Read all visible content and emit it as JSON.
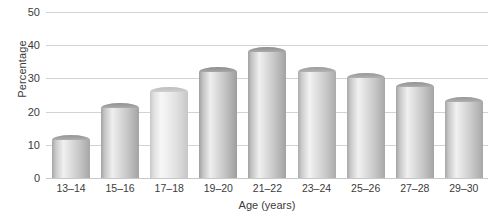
{
  "chart_data": {
    "type": "bar",
    "title": "",
    "xlabel": "Age (years)",
    "ylabel": "Percentage",
    "categories": [
      "13–14",
      "15–16",
      "17–18",
      "19–20",
      "21–22",
      "23–24",
      "25–26",
      "27–28",
      "29–30"
    ],
    "values": [
      11.5,
      21,
      26,
      32,
      38,
      32,
      30,
      27.5,
      23
    ],
    "ylim": [
      0,
      50
    ],
    "yticks": [
      0,
      10,
      20,
      30,
      40,
      50
    ],
    "ytick_labels": [
      "0",
      "10",
      "20",
      "30",
      "40",
      "50"
    ],
    "grid": true,
    "legend": "none",
    "series": [
      {
        "name": "Percentage",
        "values": [
          11.5,
          21,
          26,
          32,
          38,
          32,
          30,
          27.5,
          23
        ]
      }
    ],
    "bar_style": "3d-cylinder",
    "colors": {
      "grid": "#d2d2d2",
      "axis_text": "#3b3b3b",
      "bar_light": "#e3e3e3",
      "bar_mid": "#bdbdbd",
      "bar_dark": "#9a9a9a",
      "bar_cap": "#8f8f8f",
      "background": "#ffffff"
    }
  }
}
